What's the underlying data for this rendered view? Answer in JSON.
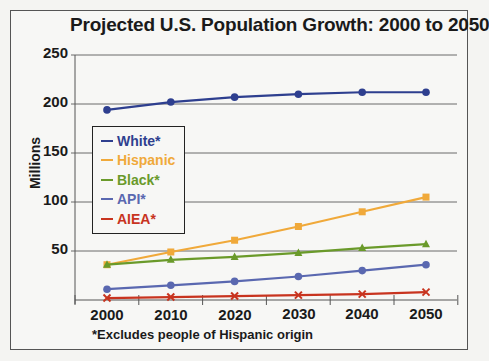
{
  "chart": {
    "title": "Projected U.S. Population Growth: 2000 to 2050",
    "ylabel": "Millions",
    "footnote": "*Excludes people of Hispanic origin",
    "yticks": [
      "250",
      "200",
      "150",
      "100",
      "50"
    ],
    "xticks": [
      "2000",
      "2010",
      "2020",
      "2030",
      "2040",
      "2050"
    ],
    "legend": [
      {
        "label": "White*",
        "color": "#2e3f8f"
      },
      {
        "label": "Hispanic",
        "color": "#f0a93a"
      },
      {
        "label": "Black*",
        "color": "#6a9a2a"
      },
      {
        "label": "API*",
        "color": "#5a68b0"
      },
      {
        "label": "AIEA*",
        "color": "#c8341f"
      }
    ]
  },
  "chart_data": {
    "type": "line",
    "title": "Projected U.S. Population Growth: 2000 to 2050",
    "xlabel": "",
    "ylabel": "Millions",
    "x": [
      2000,
      2010,
      2020,
      2030,
      2040,
      2050
    ],
    "ylim": [
      0,
      250
    ],
    "yticks": [
      50,
      100,
      150,
      200,
      250
    ],
    "grid": "horizontal",
    "legend_position": "upper-left inside",
    "footnote": "*Excludes people of Hispanic origin",
    "series": [
      {
        "name": "White*",
        "color": "#2e3f8f",
        "marker": "circle",
        "values": [
          194,
          202,
          207,
          210,
          212,
          212
        ]
      },
      {
        "name": "Hispanic",
        "color": "#f0a93a",
        "marker": "square",
        "values": [
          36,
          49,
          61,
          75,
          90,
          105
        ]
      },
      {
        "name": "Black*",
        "color": "#6a9a2a",
        "marker": "triangle",
        "values": [
          36,
          41,
          44,
          48,
          53,
          57
        ]
      },
      {
        "name": "API*",
        "color": "#5a68b0",
        "marker": "circle",
        "values": [
          11,
          15,
          19,
          24,
          30,
          36
        ]
      },
      {
        "name": "AIEA*",
        "color": "#c8341f",
        "marker": "x",
        "values": [
          2,
          3,
          4,
          5,
          6,
          8
        ]
      }
    ]
  }
}
